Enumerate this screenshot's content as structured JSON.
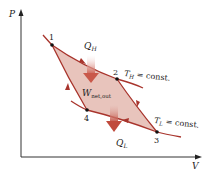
{
  "diagram": {
    "axes": {
      "y_label": "P",
      "x_label": "V"
    },
    "points": [
      {
        "id": "1",
        "label": "1",
        "x": 52,
        "y": 45
      },
      {
        "id": "2",
        "label": "2",
        "x": 117,
        "y": 79
      },
      {
        "id": "3",
        "label": "3",
        "x": 157,
        "y": 132
      },
      {
        "id": "4",
        "label": "4",
        "x": 87,
        "y": 110
      }
    ],
    "labels": {
      "q_h_main": "Q",
      "q_h_sub": "H",
      "q_l_main": "Q",
      "q_l_sub": "L",
      "w_main": "W",
      "w_sub": "net,out",
      "t_h_main": "T",
      "t_h_sub": "H",
      "t_h_rest": " = const.",
      "t_l_main": "T",
      "t_l_sub": "L",
      "t_l_rest": " = const."
    },
    "colors": {
      "curve": "#a8342c",
      "fill": "#e8c4bc",
      "arrow_fill": "#c9584a",
      "axis": "#333333",
      "point": "#111111"
    }
  }
}
